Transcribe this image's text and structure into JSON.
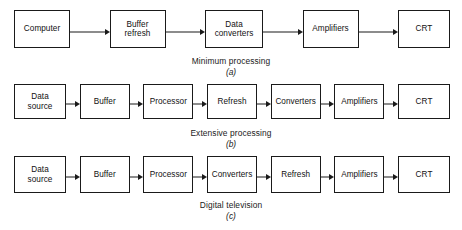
{
  "figure": {
    "background_color": "#ffffff",
    "line_color": "#1a1a1a",
    "rows": [
      {
        "id": "a",
        "caption_title": "Minimum processing",
        "caption_letter": "(a)",
        "nodes": [
          {
            "label": "Computer"
          },
          {
            "label": "Buffer\nrefresh",
            "line1": "Buffer",
            "line2": "refresh"
          },
          {
            "label": "Data\nconverters",
            "line1": "Data",
            "line2": "converters"
          },
          {
            "label": "Amplifiers"
          },
          {
            "label": "CRT"
          }
        ]
      },
      {
        "id": "b",
        "caption_title": "Extensive processing",
        "caption_letter": "(b)",
        "nodes": [
          {
            "label": "Data\nsource",
            "line1": "Data",
            "line2": "source"
          },
          {
            "label": "Buffer"
          },
          {
            "label": "Processor"
          },
          {
            "label": "Refresh"
          },
          {
            "label": "Converters"
          },
          {
            "label": "Amplifiers"
          },
          {
            "label": "CRT"
          }
        ]
      },
      {
        "id": "c",
        "caption_title": "Digital television",
        "caption_letter": "(c)",
        "nodes": [
          {
            "label": "Data\nsource",
            "line1": "Data",
            "line2": "source"
          },
          {
            "label": "Buffer"
          },
          {
            "label": "Processor"
          },
          {
            "label": "Converters"
          },
          {
            "label": "Refresh"
          },
          {
            "label": "Amplifiers"
          },
          {
            "label": "CRT"
          }
        ]
      }
    ]
  }
}
